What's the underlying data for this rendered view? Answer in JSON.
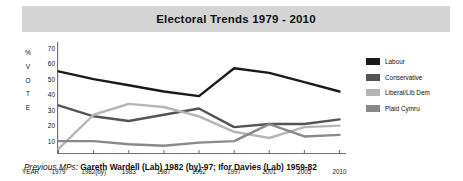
{
  "title": "Electoral Trends 1979 - 2010",
  "vertical_axis_caption": [
    "%",
    "V",
    "O",
    "T",
    "E"
  ],
  "xaxis_caption": "YEAR",
  "footnote": {
    "lead": "Previous MPs:",
    "body": "Gareth Wardell (Lab) 1982 (by)-97; Ifor Davies (Lab) 1959-82"
  },
  "legend": {
    "items": [
      {
        "label": "Labour",
        "color": "#1a1a1a"
      },
      {
        "label": "Conservative",
        "color": "#545454"
      },
      {
        "label": "Liberal/Lib Dem",
        "color": "#b5b5b5"
      },
      {
        "label": "Plaid Cymru",
        "color": "#898989"
      }
    ]
  },
  "chart_data": {
    "type": "line",
    "title": "Electoral Trends 1979 - 2010",
    "xlabel": "YEAR",
    "ylabel": "% VOTE",
    "categories": [
      "1979",
      "1982(by)",
      "1983",
      "1987",
      "1992",
      "1997",
      "2001",
      "2005",
      "2010"
    ],
    "ytick_labels": [
      "10",
      "20",
      "30",
      "40",
      "50",
      "60",
      "70"
    ],
    "ylim": [
      0,
      70
    ],
    "grid": false,
    "legend_position": "right",
    "series": [
      {
        "name": "Labour",
        "color": "#1a1a1a",
        "values": [
          53,
          48,
          44,
          40,
          37,
          55,
          52,
          46,
          40
        ]
      },
      {
        "name": "Conservative",
        "color": "#545454",
        "values": [
          31,
          24,
          21,
          25,
          29,
          17,
          19,
          19,
          22
        ]
      },
      {
        "name": "Liberal/Lib Dem",
        "color": "#b5b5b5",
        "values": [
          3,
          25,
          32,
          30,
          24,
          14,
          10,
          17,
          18
        ]
      },
      {
        "name": "Plaid Cymru",
        "color": "#898989",
        "values": [
          8,
          8,
          6,
          5,
          7,
          8,
          19,
          11,
          12
        ]
      }
    ]
  }
}
